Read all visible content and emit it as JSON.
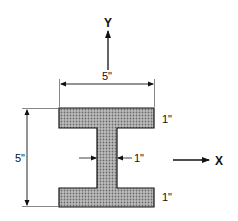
{
  "diagram": {
    "type": "I-beam cross section",
    "axes": {
      "y_label": "Y",
      "x_label": "X"
    },
    "dimensions": {
      "flange_width": "5\"",
      "overall_height": "5\"",
      "web_thickness": "1\"",
      "top_flange_thickness": "1\"",
      "bottom_flange_thickness": "1\""
    },
    "colors": {
      "fill": "#a8a8a8",
      "stroke": "#111111",
      "background": "#ffffff"
    }
  }
}
